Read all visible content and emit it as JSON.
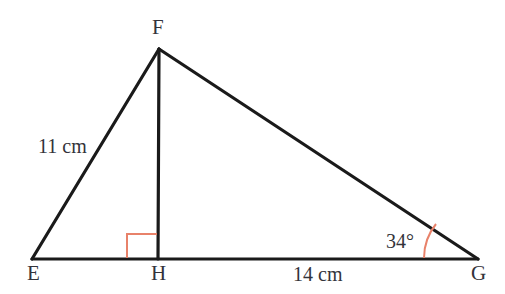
{
  "diagram": {
    "kind": "geometry-triangle",
    "canvas": {
      "width": 505,
      "height": 294
    },
    "colors": {
      "stroke": "#1a1a1a",
      "accent": "#e8826a",
      "text": "#33333a",
      "background": "#ffffff"
    },
    "vertices": {
      "E": {
        "label": "E",
        "x": 32,
        "y": 259
      },
      "F": {
        "label": "F",
        "x": 159,
        "y": 49
      },
      "G": {
        "label": "G",
        "x": 478,
        "y": 259
      },
      "H": {
        "label": "H",
        "x": 158,
        "y": 259
      }
    },
    "segments": [
      {
        "name": "EF",
        "from": "E",
        "to": "F"
      },
      {
        "name": "FG",
        "from": "F",
        "to": "G"
      },
      {
        "name": "EG",
        "from": "E",
        "to": "G"
      },
      {
        "name": "FH",
        "from": "F",
        "to": "H"
      }
    ],
    "measures": {
      "side_ef": "11 cm",
      "side_hg": "14 cm"
    },
    "angles": {
      "at_g": "34°",
      "at_h": "90°"
    },
    "markers": {
      "right_angle_at_h": true,
      "arc_at_g": true
    }
  }
}
